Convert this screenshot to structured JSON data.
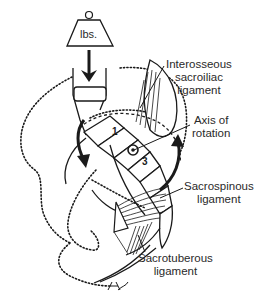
{
  "figure": {
    "weight": {
      "label": "lbs."
    },
    "segments": [
      {
        "number": "1"
      },
      {
        "number": "3"
      }
    ],
    "labels": {
      "interosseous": [
        "Interosseous",
        "sacroiliac",
        "ligament"
      ],
      "axis": [
        "Axis of",
        "rotation"
      ],
      "sacrospinous": [
        "Sacrospinous",
        "ligament"
      ],
      "sacrotuberous": [
        "Sacrotuberous",
        "ligament"
      ]
    },
    "colors": {
      "ink": "#1a1a1a",
      "text": "#2a2a2a",
      "background": "#ffffff"
    }
  }
}
